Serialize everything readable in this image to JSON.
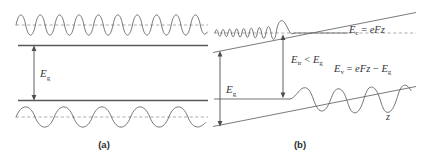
{
  "figure": {
    "background_color": "#ffffff",
    "line_color": "#5d5d60",
    "text_color": "#35353a"
  },
  "panels": [
    {
      "id": "a",
      "caption": "(a)",
      "description": "Flat bands with Bloch-like oscillatory wavefunctions above the conduction band edge and below the valence band edge, separated by the band gap",
      "labels": [
        {
          "name": "band-gap",
          "base": "E",
          "subscript": "g",
          "text": "Eg"
        }
      ],
      "waves": [
        {
          "name": "conduction-wave",
          "cycles": 9,
          "kind": "sinusoid",
          "note": "high frequency, above conduction band edge"
        },
        {
          "name": "valence-wave",
          "cycles": 4.5,
          "kind": "sinusoid",
          "note": "lower frequency, below valence band edge"
        }
      ],
      "band_edges": [
        {
          "name": "conduction-band-edge",
          "kind": "horizontal"
        },
        {
          "name": "valence-band-edge",
          "kind": "horizontal"
        }
      ]
    },
    {
      "id": "b",
      "caption": "(b)",
      "description": "Tilted bands under an electric field with Airy-function wavefunctions tunneling into the gap, allowing a below-gap transition",
      "labels": [
        {
          "name": "conduction-band-energy",
          "text": "Ec = eFz",
          "base": "E",
          "subscript": "c",
          "rhs": "eFz"
        },
        {
          "name": "valence-band-energy",
          "text": "Ev = eFz − Eg",
          "base": "E",
          "subscript": "v",
          "rhs": "eFz − Eg"
        },
        {
          "name": "transition-energy",
          "text": "Etr < Eg",
          "base": "E",
          "subscript": "tr",
          "rhs": "Eg"
        },
        {
          "name": "band-gap",
          "base": "E",
          "subscript": "g",
          "text": "Eg"
        },
        {
          "name": "z-axis",
          "text": "z"
        }
      ],
      "waves": [
        {
          "name": "conduction-airy-wave",
          "kind": "airy",
          "note": "chirped oscillation decaying past turning point to the right"
        },
        {
          "name": "valence-airy-wave",
          "kind": "airy",
          "note": "flat to the left of turning point, oscillations growing to the right"
        }
      ],
      "band_edges": [
        {
          "name": "conduction-band-tilted-line",
          "kind": "tilted"
        },
        {
          "name": "valence-band-tilted-line",
          "kind": "tilted"
        }
      ],
      "arrows": [
        {
          "name": "band-gap-arrow",
          "kind": "double-headed-vertical"
        },
        {
          "name": "transition-arrow",
          "kind": "double-headed-vertical"
        }
      ]
    }
  ]
}
